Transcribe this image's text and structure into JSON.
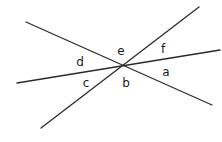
{
  "diagram": {
    "type": "intersecting-lines-angles",
    "intersection": {
      "x": 123,
      "y": 66
    },
    "lines": [
      {
        "id": "line-1",
        "x1": 26,
        "y1": 22,
        "x2": 212,
        "y2": 105
      },
      {
        "id": "line-2",
        "x1": 17,
        "y1": 83,
        "x2": 220,
        "y2": 50
      },
      {
        "id": "line-3",
        "x1": 41,
        "y1": 128,
        "x2": 199,
        "y2": 7
      }
    ],
    "angles": [
      {
        "label": "a",
        "x": 166,
        "y": 76
      },
      {
        "label": "b",
        "x": 126,
        "y": 87
      },
      {
        "label": "c",
        "x": 86,
        "y": 87
      },
      {
        "label": "d",
        "x": 80,
        "y": 66
      },
      {
        "label": "e",
        "x": 121,
        "y": 55
      },
      {
        "label": "f",
        "x": 163,
        "y": 53
      }
    ]
  },
  "colors": {
    "line": "#2a2a2a",
    "text": "#1a1a1a",
    "background": "#ffffff"
  }
}
